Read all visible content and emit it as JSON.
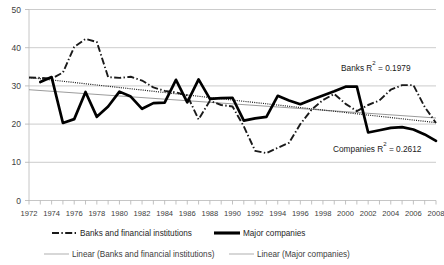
{
  "chart_data": {
    "type": "line",
    "title": "",
    "xlabel": "",
    "ylabel": "",
    "ylim": [
      0,
      50
    ],
    "xlim": [
      1972,
      2008
    ],
    "grid": true,
    "legend_position": "bottom",
    "yticks": [
      0,
      10,
      20,
      30,
      40,
      50
    ],
    "x": [
      1972,
      1973,
      1974,
      1975,
      1976,
      1977,
      1978,
      1979,
      1980,
      1981,
      1982,
      1983,
      1984,
      1985,
      1986,
      1987,
      1988,
      1989,
      1990,
      1991,
      1992,
      1993,
      1994,
      1995,
      1996,
      1997,
      1998,
      1999,
      2000,
      2001,
      2002,
      2003,
      2004,
      2005,
      2006,
      2007,
      2008
    ],
    "xtick_labels": [
      "1972",
      "1974",
      "1976",
      "1978",
      "1980",
      "1982",
      "1984",
      "1986",
      "1988",
      "1990",
      "1992",
      "1994",
      "1996",
      "1998",
      "2000",
      "2002",
      "2004",
      "2006",
      "2008"
    ],
    "series": [
      {
        "name": "Banks and financial institutions",
        "style": "dash-dot",
        "color": "#1a1a1a",
        "values": [
          32.2,
          32.1,
          31.9,
          33.5,
          40.2,
          42.3,
          41.5,
          32.3,
          32.1,
          32.4,
          31.4,
          29.6,
          28.7,
          28.3,
          27.5,
          21.2,
          26.1,
          25.0,
          24.6,
          19.4,
          13.0,
          12.4,
          13.8,
          15.1,
          20.0,
          23.8,
          26.3,
          27.9,
          25.3,
          23.4,
          25.0,
          26.2,
          29.0,
          30.2,
          30.2,
          24.5,
          20.3
        ]
      },
      {
        "name": "Major companies",
        "style": "solid-thick",
        "color": "#000000",
        "values": [
          null,
          31.0,
          32.3,
          20.3,
          21.3,
          28.4,
          21.9,
          24.6,
          28.5,
          27.2,
          24.0,
          25.5,
          25.6,
          31.6,
          25.7,
          31.7,
          26.6,
          26.8,
          26.9,
          20.9,
          21.5,
          21.9,
          27.4,
          26.2,
          25.2,
          26.4,
          27.5,
          28.6,
          29.8,
          29.8,
          17.8,
          18.4,
          19.0,
          19.2,
          18.6,
          17.3,
          15.6
        ]
      }
    ],
    "trendlines": [
      {
        "name": "Linear (Banks and financial institutions)",
        "style": "dotted",
        "color": "#1a1a1a",
        "start": {
          "x": 1972,
          "y": 32.2
        },
        "end": {
          "x": 2008,
          "y": 20.4
        }
      },
      {
        "name": "Linear (Major companies)",
        "style": "thin-solid",
        "color": "#909090",
        "start": {
          "x": 1972,
          "y": 29.0
        },
        "end": {
          "x": 2008,
          "y": 21.6
        }
      }
    ],
    "annotations": [
      {
        "name": "banks-r2",
        "text_prefix": "Banks R",
        "text_sup": "2",
        "text_suffix": " = 0.1979",
        "value": 0.1979,
        "full_text": "Banks R2 = 0.1979"
      },
      {
        "name": "companies-r2",
        "text_prefix": "Companies R",
        "text_sup": "2",
        "text_suffix": " = 0.2612",
        "value": 0.2612,
        "full_text": "Companies R2 = 0.2612"
      }
    ]
  },
  "legend": {
    "row1": [
      {
        "label": "Banks and financial institutions",
        "marker": "dash-dot-line"
      },
      {
        "label": "Major companies",
        "marker": "thick-solid-line"
      }
    ],
    "row2": [
      {
        "label": "Linear (Banks and financial institutions)",
        "marker": "thin-line"
      },
      {
        "label": "Linear (Major companies)",
        "marker": "thin-line"
      }
    ]
  },
  "axis": {
    "y_labels": [
      "50",
      "40",
      "30",
      "20",
      "10",
      "0"
    ],
    "x_labels": [
      "1972",
      "1974",
      "1976",
      "1978",
      "1980",
      "1982",
      "1984",
      "1986",
      "1988",
      "1990",
      "1992",
      "1994",
      "1996",
      "1998",
      "2000",
      "2002",
      "2004",
      "2006",
      "2008"
    ]
  },
  "colors": {
    "banks": "#1a1a1a",
    "companies": "#000000",
    "trend_banks": "#1a1a1a",
    "trend_companies": "#909090",
    "grid": "#bfbfbf",
    "background": "#ffffff"
  }
}
